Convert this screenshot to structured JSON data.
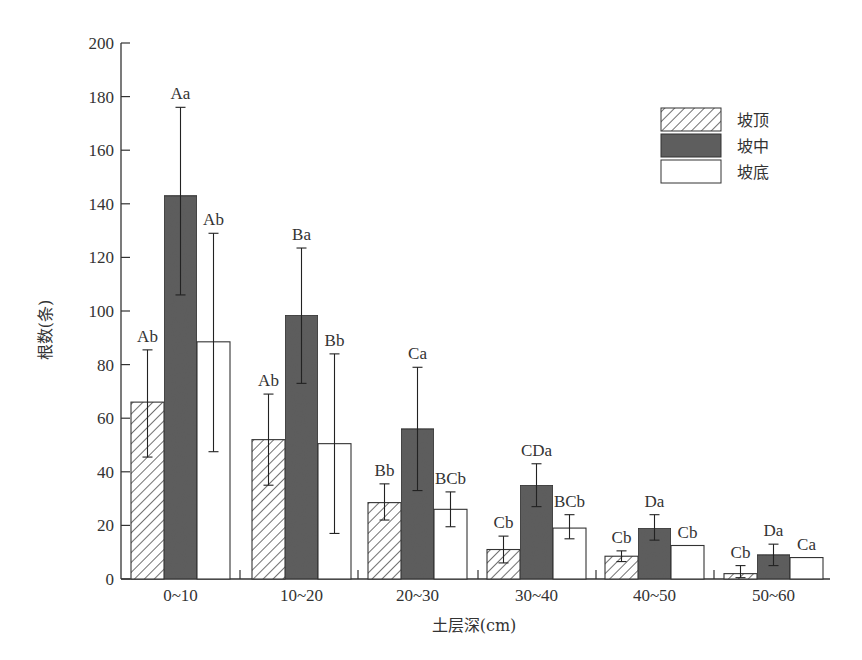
{
  "chart_data": {
    "type": "bar",
    "title": "",
    "xlabel": "土层深(cm)",
    "ylabel": "根数(条)",
    "ylim": [
      0,
      200
    ],
    "yticks": [
      0,
      20,
      40,
      60,
      80,
      100,
      120,
      140,
      160,
      180,
      200
    ],
    "grid": false,
    "legend_position": "upper right",
    "categories": [
      "0~10",
      "10~20",
      "20~30",
      "30~40",
      "40~50",
      "50~60"
    ],
    "series": [
      {
        "name": "坡顶",
        "pattern": "hatched",
        "values": [
          66,
          52,
          28.5,
          11,
          8.5,
          2
        ],
        "error_low": [
          45.5,
          35,
          22,
          6,
          6.5,
          0.5
        ],
        "error_high": [
          85.5,
          69,
          35.5,
          16,
          10.5,
          5
        ],
        "labels": [
          "Ab",
          "Ab",
          "Bb",
          "Cb",
          "Cb",
          "Cb"
        ]
      },
      {
        "name": "坡中",
        "pattern": "solid-dark",
        "color": "#5e5e5e",
        "values": [
          143,
          98.5,
          56,
          35,
          19,
          9
        ],
        "error_low": [
          106,
          73,
          33,
          27,
          14.5,
          5
        ],
        "error_high": [
          176,
          123.5,
          79,
          43,
          24,
          13
        ],
        "labels": [
          "Aa",
          "Ba",
          "Ca",
          "CDa",
          "Da",
          "Da"
        ]
      },
      {
        "name": "坡底",
        "pattern": "white",
        "color": "#ffffff",
        "values": [
          88.5,
          50.5,
          26,
          19,
          12.5,
          8
        ],
        "error_low": [
          47.5,
          17,
          19.5,
          15,
          12.5,
          8
        ],
        "error_high": [
          129,
          84,
          32.5,
          24,
          12.5,
          8
        ],
        "labels": [
          "Ab",
          "Bb",
          "BCb",
          "BCb",
          "Cb",
          "Ca"
        ]
      }
    ]
  }
}
